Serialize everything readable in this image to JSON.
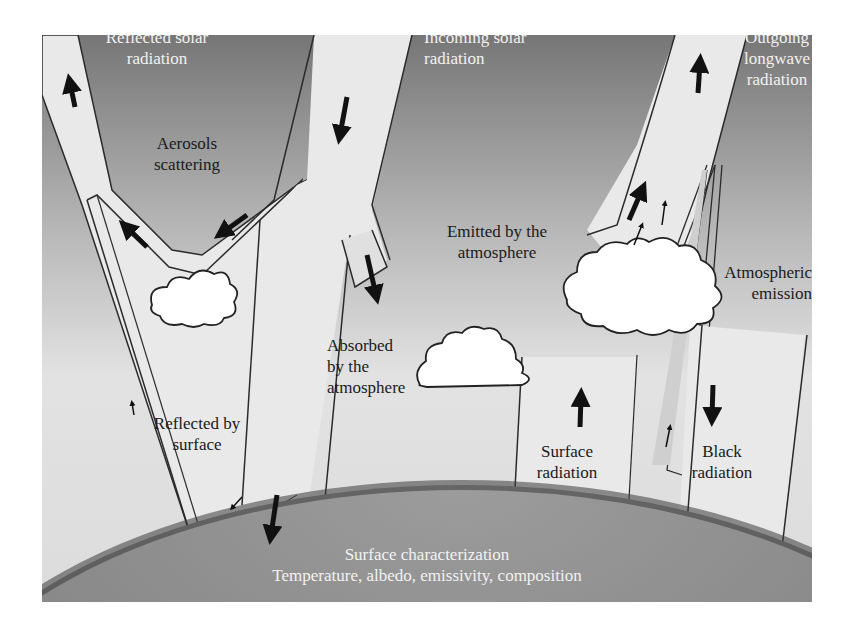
{
  "figure": {
    "colors": {
      "sky_top": "#7a7a7a",
      "sky_bottom": "#e6e6e6",
      "beam_fill": "#e9e9e9",
      "beam_stroke": "#2b2b2b",
      "arrow": "#111111",
      "earth": "#8a8a8a",
      "earth_rim": "#3c3c3c",
      "cloud": "#ffffff",
      "light_text": "#f2f2f2",
      "dark_text": "#1a1a1a"
    },
    "labels": {
      "reflected_solar": "Reflected solar\nradiation",
      "incoming_solar": "Incoming solar\nradiation",
      "outgoing_longwave": "Outgoing\nlongwave\nradiation",
      "aerosols_scattering": "Aerosols\nscattering",
      "emitted_by_atmosphere": "Emitted by the\natmosphere",
      "atmospheric_emission": "Atmospheric\nemission",
      "absorbed_by_atmosphere": "Absorbed\nby the\natmosphere",
      "reflected_by_surface": "Reflected by\nsurface",
      "surface_radiation": "Surface\nradiation",
      "black_radiation": "Black\nradiation",
      "surface_characterization": "Surface characterization",
      "surface_properties": "Temperature, albedo, emissivity, composition"
    },
    "elements": {
      "beams": [
        "reflected-solar-beam",
        "incoming-solar-beam",
        "aerosol-scatter-beam",
        "surface-reflection-beam",
        "absorbed-branch-beam",
        "outgoing-longwave-beam",
        "surface-radiation-beam",
        "black-radiation-beam",
        "atmospheric-emission-beam"
      ],
      "clouds": [
        "aerosol-cloud",
        "absorption-cloud",
        "emission-cloud"
      ],
      "arrows_up": 6,
      "arrows_down": 6
    }
  }
}
